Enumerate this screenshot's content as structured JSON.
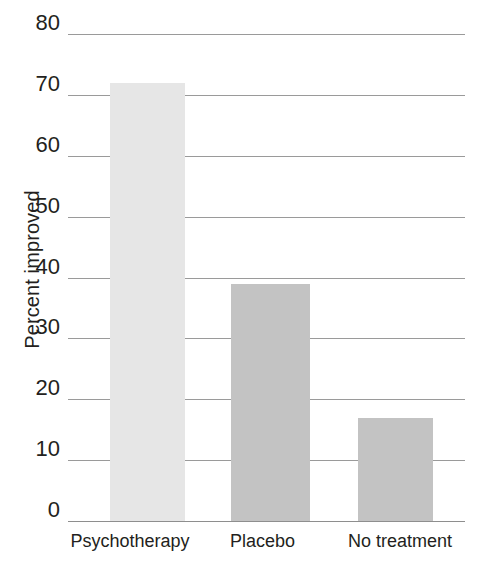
{
  "chart_data": {
    "type": "bar",
    "title": "",
    "xlabel": "",
    "ylabel": "Percent improved",
    "categories": [
      "Psychotherapy",
      "Placebo",
      "No treatment"
    ],
    "values": [
      72,
      39,
      17
    ],
    "ylim": [
      0,
      80
    ],
    "yticks": [
      0,
      10,
      20,
      30,
      40,
      50,
      60,
      70,
      80
    ],
    "ytick_labels": [
      "0",
      "10",
      "20",
      "30",
      "40",
      "50",
      "60",
      "70",
      "80"
    ],
    "grid": true,
    "legend": "none",
    "series": [
      {
        "name": "Percent improved",
        "values": [
          72,
          39,
          17
        ]
      }
    ],
    "bar_colors": [
      "#e6e6e6",
      "#c3c3c3",
      "#c3c3c3"
    ],
    "gridline_color": "#9a9a9a",
    "text_color": "#231f20",
    "background_color": "#ffffff"
  }
}
